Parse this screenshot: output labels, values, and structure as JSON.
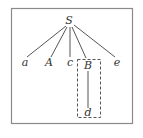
{
  "diagram": {
    "type": "parse-tree",
    "frame": {
      "x": 11,
      "y": 8,
      "width": 121,
      "height": 115,
      "stroke": "#8a8a8a"
    },
    "root": {
      "id": "S",
      "label": "S",
      "x": 69,
      "y": 24
    },
    "children": [
      {
        "id": "a",
        "label": "a",
        "x": 25,
        "y": 66
      },
      {
        "id": "A",
        "label": "A",
        "x": 49,
        "y": 66
      },
      {
        "id": "c",
        "label": "c",
        "x": 70,
        "y": 66
      },
      {
        "id": "B",
        "label": "B",
        "x": 88,
        "y": 68
      },
      {
        "id": "e",
        "label": "e",
        "x": 117,
        "y": 66
      }
    ],
    "grandchild": {
      "id": "d",
      "label": "d",
      "parent": "B",
      "x": 88,
      "y": 116
    },
    "highlight_box": {
      "x": 77,
      "y": 59,
      "width": 23,
      "height": 58,
      "style": "dashed",
      "stroke": "#555555"
    },
    "line_color": "#555555"
  }
}
